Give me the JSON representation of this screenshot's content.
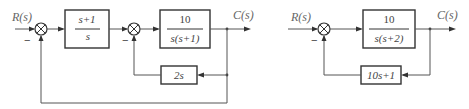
{
  "diagrams": [
    {
      "id": "left",
      "input_label": "R(s)",
      "output_label": "C(s)",
      "blocks": [
        {
          "name": "forward-block-1",
          "numerator": "s+1",
          "denominator": "s"
        },
        {
          "name": "forward-block-2",
          "numerator": "10",
          "denominator": "s(s+1)"
        },
        {
          "name": "feedback-block-inner",
          "expression": "2s"
        }
      ],
      "summing_junctions": [
        {
          "name": "outer-sum",
          "feedback_sign": "−"
        },
        {
          "name": "inner-sum",
          "feedback_sign": "−"
        }
      ],
      "feedback_loops": [
        "inner loop through 2s",
        "outer unity feedback"
      ]
    },
    {
      "id": "right",
      "input_label": "R(s)",
      "output_label": "C(s)",
      "blocks": [
        {
          "name": "forward-block",
          "numerator": "10",
          "denominator": "s(s+2)"
        },
        {
          "name": "feedback-block",
          "expression": "10s+1"
        }
      ],
      "summing_junctions": [
        {
          "name": "sum",
          "feedback_sign": "−"
        }
      ]
    }
  ],
  "colors": {
    "line": "#555555",
    "box_border": "#333333",
    "text": "#444444",
    "label": "#666666"
  }
}
